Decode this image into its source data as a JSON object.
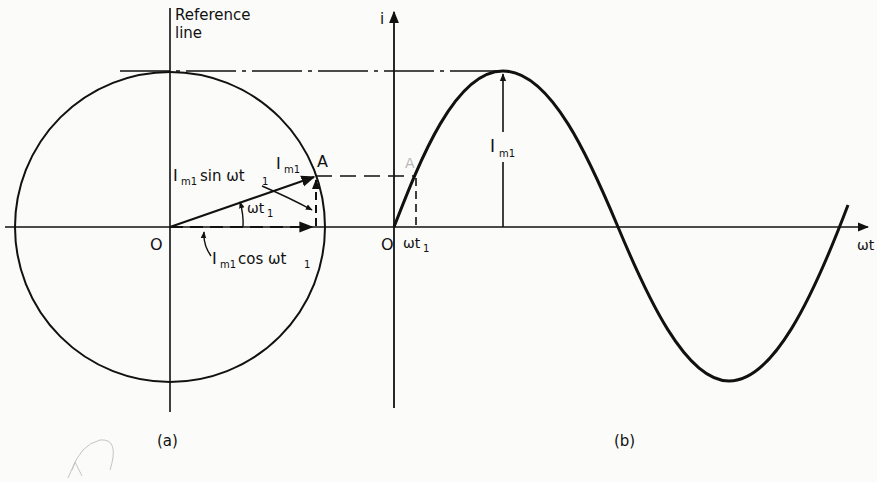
{
  "figure": {
    "panel_a": {
      "caption": "(a)",
      "reference_line_label_1": "Reference",
      "reference_line_label_2": "line",
      "origin_label": "O",
      "point_label": "A",
      "phasor_label": "I",
      "phasor_sub": "m1",
      "angle_label": "ωt",
      "angle_sub": "1",
      "sin_component_label": "I",
      "sin_component_sub": "m1",
      "sin_component_rest": " sin ωt",
      "sin_component_rest_sub": "1",
      "cos_component_label": "I",
      "cos_component_sub": "m1",
      "cos_component_rest": " cos ωt",
      "cos_component_rest_sub": "1"
    },
    "panel_b": {
      "caption": "(b)",
      "y_axis_label": "i",
      "x_axis_label": "ωt",
      "origin_label": "O",
      "t1_label": "ωt",
      "t1_sub": "1",
      "amplitude_label": "I",
      "amplitude_sub": "m1",
      "faint_point_label": "A"
    },
    "colors": {
      "ink": "#111111",
      "paper": "#fbfbf9",
      "faint": "#b9b9b9"
    }
  }
}
